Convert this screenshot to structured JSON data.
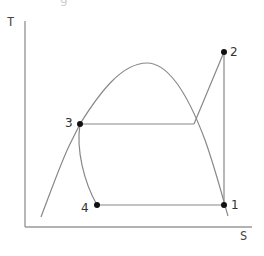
{
  "diagram": {
    "title_fragment": "g",
    "axes": {
      "y_label": "T",
      "x_label": "S"
    },
    "points": [
      {
        "id": "1",
        "label": "1"
      },
      {
        "id": "2",
        "label": "2"
      },
      {
        "id": "3",
        "label": "3"
      },
      {
        "id": "4",
        "label": "4"
      }
    ],
    "colors": {
      "lines": "#888888",
      "axes": "#999999",
      "points": "#111111",
      "text": "#333333"
    }
  }
}
